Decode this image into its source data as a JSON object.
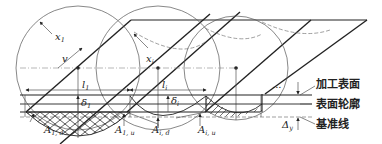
{
  "diagram": {
    "type": "machining surface profile schematic",
    "labels": {
      "x1": "x",
      "x1_sub": "1",
      "xi": "x",
      "xi_sub": "i",
      "v": "v",
      "l1": "l",
      "l1_sub": "1",
      "li": "l",
      "li_sub": "i",
      "delta1": "δ",
      "delta1_sub": "1",
      "deltai": "δ",
      "deltai_sub": "i",
      "A1d": "A",
      "A1d_sub": "1, d",
      "A1u": "A",
      "A1u_sub": "1, u",
      "Aid": "A",
      "Aid_sub": "i, d",
      "Aiu": "A",
      "Aiu_sub": "i, u",
      "delta_y": "Δ",
      "delta_y_sub": "y",
      "ellipsis": "..."
    },
    "legend": {
      "machined_surface": "加工表面",
      "surface_profile": "表面轮廓",
      "reference_line": "基准线"
    }
  }
}
